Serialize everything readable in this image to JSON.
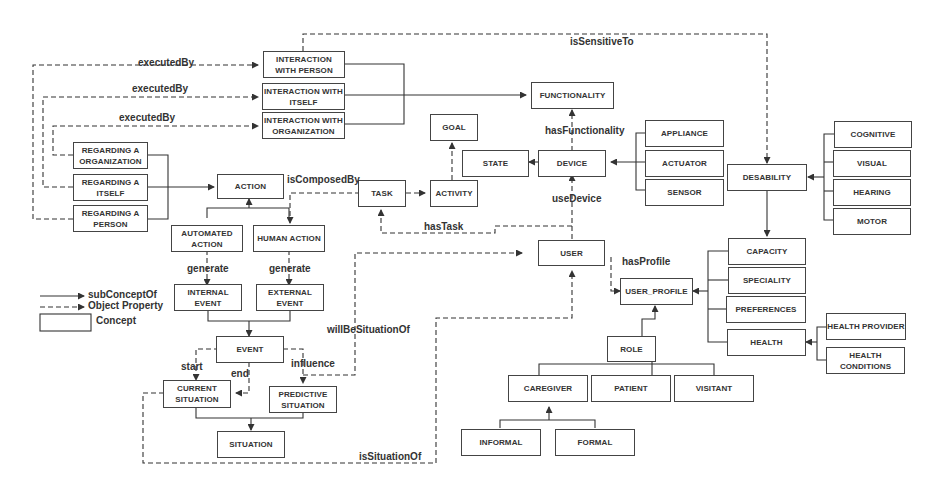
{
  "diagram": {
    "concepts": {
      "interaction_person": "INTERACTION\nWITH PERSON",
      "interaction_itself": "INTERACTION WITH\nITSELF",
      "interaction_org": "INTERACTION WITH\nORGANIZATION",
      "functionality": "FUNCTIONALITY",
      "goal": "GOAL",
      "state": "STATE",
      "device": "DEVICE",
      "appliance": "APPLIANCE",
      "actuator": "ACTUATOR",
      "sensor": "SENSOR",
      "desability": "DESABILITY",
      "cognitive": "COGNITIVE",
      "visual": "VISUAL",
      "hearing": "HEARING",
      "motor": "MOTOR",
      "regarding_org": "REGARDING A\nORGANIZATION",
      "regarding_itself": "REGARDING A\nITSELF",
      "regarding_person": "REGARDING A\nPERSON",
      "action": "ACTION",
      "task": "TASK",
      "activity": "ACTIVITY",
      "automated_action": "AUTOMATED\nACTION",
      "human_action": "HUMAN ACTION",
      "user": "USER",
      "user_profile": "USER_PROFILE",
      "capacity": "CAPACITY",
      "speciality": "SPECIALITY",
      "preferences": "PREFERENCES",
      "health": "HEALTH",
      "health_provider": "HEALTH PROVIDER",
      "health_conditions": "HEALTH\nCONDITIONS",
      "internal_event": "INTERNAL\nEVENT",
      "external_event": "EXTERNAL\nEVENT",
      "event": "EVENT",
      "current_situation": "CURRENT\nSITUATION",
      "predictive_situation": "PREDICTIVE\nSITUATION",
      "situation": "SITUATION",
      "role": "ROLE",
      "caregiver": "CAREGIVER",
      "patient": "PATIENT",
      "visitant": "VISITANT",
      "informal": "INFORMAL",
      "formal": "FORMAL"
    },
    "properties": {
      "executed_by_1": "executedBy",
      "executed_by_2": "executedBy",
      "executed_by_3": "executedBy",
      "is_sensitive_to": "isSensitiveTo",
      "has_functionality": "hasFunctionality",
      "is_composed_by": "isComposedBy",
      "use_device": "useDevice",
      "has_task": "hasTask",
      "has_profile": "hasProfile",
      "generate_1": "generate",
      "generate_2": "generate",
      "will_be_situation_of": "willBeSituationOf",
      "start": "start",
      "end": "end",
      "influence": "influence",
      "is_situation_of": "isSituationOf"
    },
    "legend": {
      "sub_concept_of": "subConceptOf",
      "object_property": "Object Property",
      "concept": "Concept"
    }
  }
}
